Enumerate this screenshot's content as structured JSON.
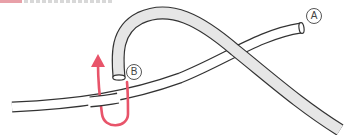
{
  "diagram": {
    "labels": {
      "a": "A",
      "b": "B"
    },
    "colors": {
      "arrow": "#e8546a",
      "tube_fill": "#e6e6e6",
      "tube_outline": "#333333",
      "header_accent": "#e8a0a8"
    },
    "elements": {
      "thin_tube": "thin white tube running from lower-left to end A at upper-right",
      "thick_tube": "thick gray tube starting at open end B, arcing up and over the thin tube, descending to lower-right",
      "arrow": "red curved arrow looping under the thin tube and pointing upward next to end B"
    }
  }
}
